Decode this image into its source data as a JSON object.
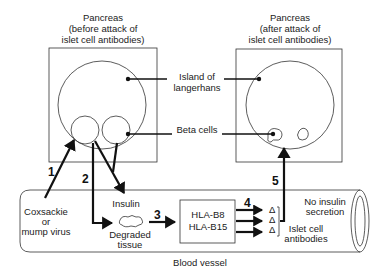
{
  "diagram": {
    "left_pancreas": {
      "title": [
        "Pancreas",
        "(before attack of",
        "islet cell antibodies)"
      ]
    },
    "right_pancreas": {
      "title": [
        "Pancreas",
        "(after attack of",
        "islet cell antibodies)"
      ]
    },
    "labels": {
      "island": [
        "Island of",
        "langerhans"
      ],
      "beta_cells": "Beta cells",
      "insulin": "Insulin",
      "virus": [
        "Coxsackie",
        "or",
        "mump virus"
      ],
      "degraded": [
        "Degraded",
        "tissue"
      ],
      "hla": [
        "HLA-B8",
        "HLA-B15"
      ],
      "no_insulin": [
        "No insulin",
        "secretion"
      ],
      "antibodies": [
        "Islet cell",
        "antibodies"
      ],
      "blood_vessel": "Blood vessel",
      "antibody_glyph": "Δ"
    },
    "steps": [
      "1",
      "2",
      "3",
      "4",
      "5"
    ],
    "colors": {
      "line": "#111111",
      "text": "#222222",
      "background": "#ffffff"
    }
  }
}
